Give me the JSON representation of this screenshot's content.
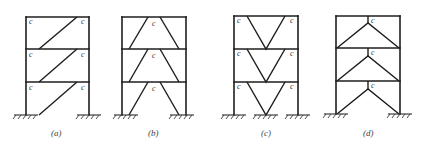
{
  "diagram": {
    "panels": [
      {
        "id": "a",
        "caption": "(a)",
        "bracing": "single-diagonal eccentric",
        "link_label": "c",
        "link_labels_per_story": [
          [
            "c",
            "c"
          ],
          [
            "c",
            "c"
          ],
          [
            "c",
            "c"
          ]
        ]
      },
      {
        "id": "b",
        "caption": "(b)",
        "bracing": "inverted-V (chevron) eccentric, link at top midspan",
        "link_label": "c",
        "link_labels_per_story": [
          [
            "c"
          ],
          [
            "c"
          ],
          [
            "c"
          ]
        ]
      },
      {
        "id": "c",
        "caption": "(c)",
        "bracing": "V-braced eccentric, links at column corners",
        "link_label": "c",
        "link_labels_per_story": [
          [
            "c",
            "c"
          ],
          [
            "c",
            "c"
          ],
          [
            "c",
            "c"
          ]
        ]
      },
      {
        "id": "d",
        "caption": "(d)",
        "bracing": "inverted-V with vertical link",
        "link_label": "c",
        "link_labels_per_story": [
          [
            "c"
          ],
          [
            "c"
          ],
          [
            "c"
          ]
        ]
      }
    ],
    "stories": 3,
    "line_color": "#1e1e1e",
    "label_color": "#333333"
  }
}
